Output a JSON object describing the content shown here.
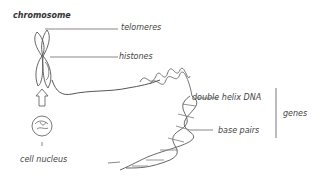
{
  "diagram": {
    "title": "chromosome",
    "labels": {
      "telomeres": "telomeres",
      "histones": "histones",
      "double_helix": "double helix DNA",
      "base_pairs": "base pairs",
      "genes": "genes",
      "cell_nucleus": "cell nucleus"
    },
    "colors": {
      "line": "#555555",
      "text": "#444444",
      "background": "#ffffff"
    }
  }
}
